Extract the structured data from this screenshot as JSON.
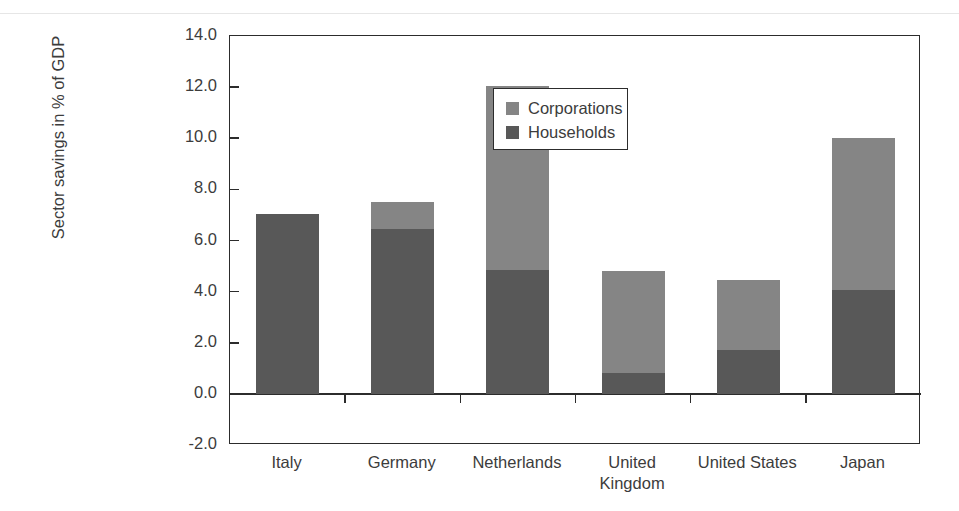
{
  "chart_data": {
    "type": "bar",
    "stacked": true,
    "title": "",
    "xlabel": "",
    "ylabel": "Sector savings in % of GDP",
    "ylim": [
      -2.0,
      14.0
    ],
    "ytick_step": 2.0,
    "ytick_labels": [
      "14.0",
      "12.0",
      "10.0",
      "8.0",
      "6.0",
      "4.0",
      "2.0",
      "0.0",
      "-2.0"
    ],
    "ytick_values": [
      14.0,
      12.0,
      10.0,
      8.0,
      6.0,
      4.0,
      2.0,
      0.0,
      -2.0
    ],
    "grid": false,
    "legend_position": "upper-left-inside",
    "categories": [
      "Italy",
      "Germany",
      "Netherlands",
      "United Kingdom",
      "United States",
      "Japan"
    ],
    "category_label_lines": [
      [
        "Italy"
      ],
      [
        "Germany"
      ],
      [
        "Netherlands"
      ],
      [
        "United",
        "Kingdom"
      ],
      [
        "United States"
      ],
      [
        "Japan"
      ]
    ],
    "series": [
      {
        "name": "Households",
        "color": "#585858",
        "values": [
          7.05,
          6.45,
          4.85,
          0.8,
          1.7,
          4.05
        ]
      },
      {
        "name": "Corporations",
        "color": "#858585",
        "values": [
          0.0,
          1.05,
          7.2,
          4.0,
          2.75,
          5.95
        ]
      }
    ],
    "totals": [
      7.05,
      7.5,
      12.05,
      4.8,
      4.45,
      10.0
    ]
  },
  "legend": {
    "items": [
      {
        "label": "Corporations",
        "color": "#858585"
      },
      {
        "label": "Households",
        "color": "#585858"
      }
    ]
  },
  "colors": {
    "corporations": "#858585",
    "households": "#585858",
    "axis": "#2c2c2c",
    "text": "#3c3c3c",
    "background": "#ffffff"
  }
}
